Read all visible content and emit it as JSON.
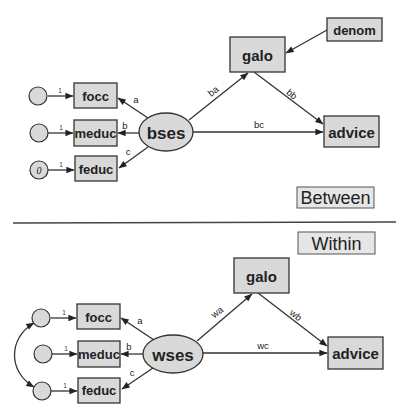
{
  "between": {
    "section_label": "Between",
    "latent": "bses",
    "indicators": [
      "focc",
      "meduc",
      "feduc"
    ],
    "indicator_paths": [
      "a",
      "b",
      "c"
    ],
    "error_fixed_loadings": [
      "1",
      "1",
      "1"
    ],
    "error_variance_fixed": "0",
    "mediator": "galo",
    "covariate": "denom",
    "outcome": "advice",
    "paths": {
      "to_mediator": "ba",
      "mediator_to_outcome": "bb",
      "direct": "bc"
    }
  },
  "within": {
    "section_label": "Within",
    "latent": "wses",
    "indicators": [
      "focc",
      "meduc",
      "feduc"
    ],
    "indicator_paths": [
      "a",
      "b",
      "c"
    ],
    "error_fixed_loadings": [
      "1",
      "1",
      "1"
    ],
    "mediator": "galo",
    "outcome": "advice",
    "paths": {
      "to_mediator": "wa",
      "mediator_to_outcome": "wb",
      "direct": "wc"
    }
  },
  "colors": {
    "node_fill": "#d9d9d9",
    "stroke": "#333333",
    "section_fill": "#e6e6e6"
  }
}
